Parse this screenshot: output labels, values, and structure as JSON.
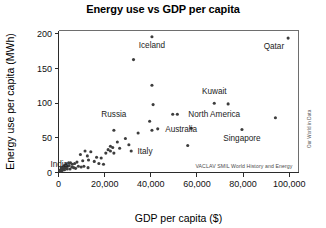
{
  "chart_data": {
    "type": "scatter",
    "title": "Energy use vs GDP per capita",
    "xlabel": "GDP per capita ($)",
    "ylabel": "Energy use per capita (MWh)",
    "xlim": [
      0,
      104000
    ],
    "ylim": [
      0,
      205
    ],
    "grid": false,
    "legend": null,
    "xticks": [
      0,
      20000,
      40000,
      60000,
      80000,
      100000
    ],
    "xticklabels": [
      "0",
      "20,000",
      "40,000",
      "60,000",
      "80,000",
      "100,000"
    ],
    "yticks": [
      0,
      50,
      100,
      150,
      200
    ],
    "yticklabels": [
      "0",
      "50",
      "100",
      "150",
      "200"
    ],
    "annotations": [
      {
        "text": "Iceland",
        "x": 40500,
        "y": 196,
        "anchor": "middle",
        "dx": 0,
        "dy": 11
      },
      {
        "text": "Qatar",
        "x": 99500,
        "y": 194,
        "anchor": "end",
        "dx": -4,
        "dy": 11
      },
      {
        "text": "Kuwait",
        "x": 67500,
        "y": 103,
        "anchor": "middle",
        "dx": 0,
        "dy": -7
      },
      {
        "text": "North America",
        "x": 54500,
        "y": 84,
        "anchor": "start",
        "dx": 4,
        "dy": 3
      },
      {
        "text": "Singapore",
        "x": 79500,
        "y": 62,
        "anchor": "middle",
        "dx": 0,
        "dy": 11
      },
      {
        "text": "Australia",
        "x": 44500,
        "y": 63,
        "anchor": "start",
        "dx": 4,
        "dy": 3
      },
      {
        "text": "Russia",
        "x": 24000,
        "y": 72,
        "anchor": "middle",
        "dx": 0,
        "dy": -6
      },
      {
        "text": "Italy",
        "x": 32500,
        "y": 31,
        "anchor": "start",
        "dx": 4,
        "dy": 3
      },
      {
        "text": "India",
        "x": 5500,
        "y": 13,
        "anchor": "end",
        "dx": -3,
        "dy": 3
      }
    ],
    "attribution": "VACLAV SMIL World History and Energy",
    "credit": "Our World in Data",
    "points": [
      {
        "x": 40500,
        "y": 196
      },
      {
        "x": 99500,
        "y": 194
      },
      {
        "x": 32500,
        "y": 163
      },
      {
        "x": 40500,
        "y": 126
      },
      {
        "x": 67500,
        "y": 100
      },
      {
        "x": 73500,
        "y": 99
      },
      {
        "x": 41000,
        "y": 98
      },
      {
        "x": 49500,
        "y": 84
      },
      {
        "x": 51500,
        "y": 84
      },
      {
        "x": 94000,
        "y": 79
      },
      {
        "x": 39500,
        "y": 74
      },
      {
        "x": 57500,
        "y": 64
      },
      {
        "x": 43000,
        "y": 63
      },
      {
        "x": 40500,
        "y": 61
      },
      {
        "x": 79500,
        "y": 62
      },
      {
        "x": 24000,
        "y": 61
      },
      {
        "x": 34500,
        "y": 57
      },
      {
        "x": 29000,
        "y": 49
      },
      {
        "x": 25500,
        "y": 44
      },
      {
        "x": 56000,
        "y": 39
      },
      {
        "x": 30500,
        "y": 40
      },
      {
        "x": 22500,
        "y": 38
      },
      {
        "x": 23500,
        "y": 36
      },
      {
        "x": 26500,
        "y": 35
      },
      {
        "x": 21500,
        "y": 33
      },
      {
        "x": 22500,
        "y": 31
      },
      {
        "x": 31500,
        "y": 31
      },
      {
        "x": 24000,
        "y": 28
      },
      {
        "x": 20500,
        "y": 28
      },
      {
        "x": 11500,
        "y": 31
      },
      {
        "x": 14000,
        "y": 30
      },
      {
        "x": 9500,
        "y": 26
      },
      {
        "x": 12500,
        "y": 24
      },
      {
        "x": 16500,
        "y": 22
      },
      {
        "x": 18500,
        "y": 21
      },
      {
        "x": 13000,
        "y": 18
      },
      {
        "x": 15500,
        "y": 16
      },
      {
        "x": 10500,
        "y": 17
      },
      {
        "x": 8000,
        "y": 15
      },
      {
        "x": 7000,
        "y": 13
      },
      {
        "x": 6000,
        "y": 12
      },
      {
        "x": 5200,
        "y": 14
      },
      {
        "x": 4600,
        "y": 10
      },
      {
        "x": 4000,
        "y": 9
      },
      {
        "x": 3400,
        "y": 8
      },
      {
        "x": 2800,
        "y": 7
      },
      {
        "x": 2200,
        "y": 6
      },
      {
        "x": 1800,
        "y": 5
      },
      {
        "x": 1400,
        "y": 5
      },
      {
        "x": 1000,
        "y": 4
      },
      {
        "x": 2500,
        "y": 10
      },
      {
        "x": 3200,
        "y": 12
      },
      {
        "x": 4400,
        "y": 14
      },
      {
        "x": 5800,
        "y": 8
      },
      {
        "x": 6600,
        "y": 7
      },
      {
        "x": 8600,
        "y": 9
      },
      {
        "x": 9800,
        "y": 8
      },
      {
        "x": 7400,
        "y": 6
      },
      {
        "x": 3800,
        "y": 5
      },
      {
        "x": 2000,
        "y": 8
      },
      {
        "x": 1600,
        "y": 3
      },
      {
        "x": 900,
        "y": 2
      },
      {
        "x": 600,
        "y": 3
      },
      {
        "x": 1200,
        "y": 7
      },
      {
        "x": 2600,
        "y": 4
      },
      {
        "x": 5000,
        "y": 5
      },
      {
        "x": 11000,
        "y": 9
      },
      {
        "x": 12800,
        "y": 7
      },
      {
        "x": 17500,
        "y": 13
      },
      {
        "x": 19500,
        "y": 12
      }
    ]
  }
}
